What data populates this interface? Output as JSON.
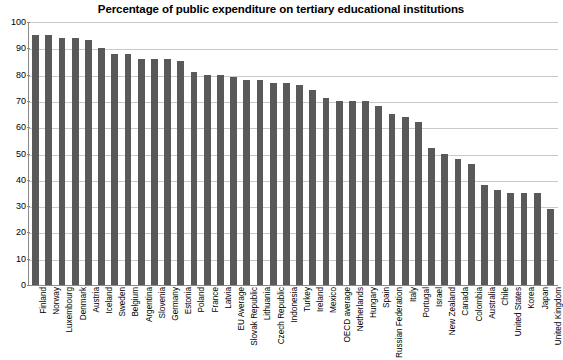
{
  "chart_data": {
    "type": "bar",
    "title": "Percentage of public expenditure on tertiary educational institutions",
    "xlabel": "",
    "ylabel": "",
    "ylim": [
      0,
      100
    ],
    "yticks": [
      0,
      10,
      20,
      30,
      40,
      50,
      60,
      70,
      80,
      90,
      100
    ],
    "grid": true,
    "legend": "none",
    "bar_color": "#595959",
    "categories": [
      "Finland",
      "Norway",
      "Luxembourg",
      "Denmark",
      "Austria",
      "Iceland",
      "Sweden",
      "Belgium",
      "Argentina",
      "Slovenia",
      "Germany",
      "Estonia",
      "Poland",
      "France",
      "Latvia",
      "EU Average",
      "Slovak Republic",
      "Lithuania",
      "Czech Republic",
      "Indonesia",
      "Turkey",
      "Ireland",
      "Mexico",
      "OECD average",
      "Netherlands",
      "Hungary",
      "Spain",
      "Russian Federation",
      "Italy",
      "Portugal",
      "Israel",
      "New Zealand",
      "Canada",
      "Colombia",
      "Australia",
      "Chile",
      "United States",
      "Korea",
      "Japan",
      "United Kingdom"
    ],
    "values": [
      95,
      95,
      94,
      94,
      93,
      90,
      88,
      88,
      86,
      86,
      86,
      85,
      81,
      80,
      80,
      79,
      78,
      78,
      77,
      77,
      76,
      74,
      71,
      70,
      70,
      70,
      68,
      65,
      64,
      62,
      52,
      50,
      48,
      46,
      38,
      36,
      35,
      35,
      35,
      29
    ]
  }
}
